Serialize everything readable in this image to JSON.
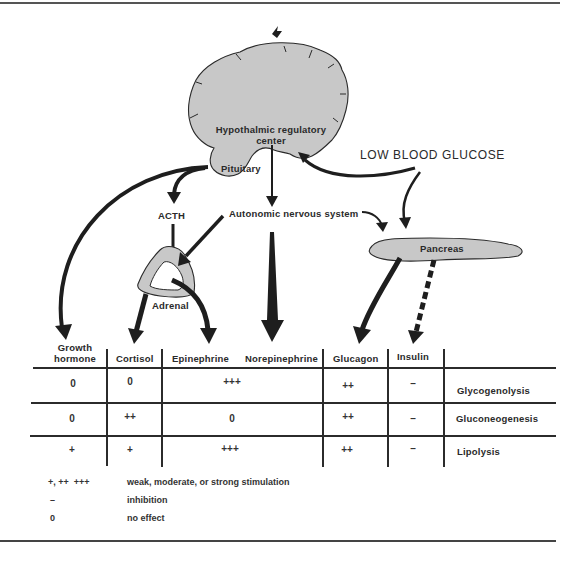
{
  "figure": {
    "colors": {
      "organ_fill": "#c8c8c8",
      "ink": "#1e1e1e",
      "background": "#ffffff"
    },
    "organs": {
      "hypothalamus": "Hypothalmic regulatory\ncenter",
      "hypothalamus_line1": "Hypothalmic regulatory",
      "hypothalamus_line2": "center",
      "pituitary": "Pituitary",
      "adrenal": "Adrenal",
      "pancreas": "Pancreas"
    },
    "labels": {
      "acth": "ACTH",
      "ans": "Autonomic nervous system",
      "stimulus": "LOW BLOOD GLUCOSE"
    },
    "table": {
      "columns": [
        {
          "line1": "Growth",
          "line2": "hormone"
        },
        {
          "line1": "",
          "line2": "Cortisol"
        },
        {
          "line1": "",
          "line2": "Epinephrine"
        },
        {
          "line1": "",
          "line2": "Norepinephrine"
        },
        {
          "line1": "",
          "line2": "Glucagon"
        },
        {
          "line1": "",
          "line2": "Insulin"
        }
      ],
      "rows": [
        {
          "process": "Glycogenolysis",
          "growth_hormone": "0",
          "cortisol": "0",
          "catecholamines": "+++",
          "glucagon": "++",
          "insulin": "–"
        },
        {
          "process": "Gluconeogenesis",
          "growth_hormone": "0",
          "cortisol": "++",
          "catecholamines": "0",
          "glucagon": "++",
          "insulin": "–"
        },
        {
          "process": "Lipolysis",
          "growth_hormone": "+",
          "cortisol": "+",
          "catecholamines": "+++",
          "glucagon": "++",
          "insulin": "–"
        }
      ]
    },
    "legend": [
      {
        "symbol": "+, ++  +++",
        "meaning": "weak, moderate, or strong stimulation"
      },
      {
        "symbol": "–",
        "meaning": "inhibition"
      },
      {
        "symbol": "0",
        "meaning": "no effect"
      }
    ]
  }
}
